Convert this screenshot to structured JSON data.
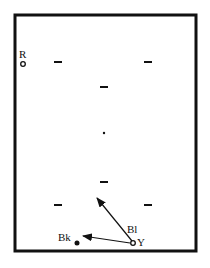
{
  "diagram": {
    "type": "snooker-table-shot-diagram",
    "table": {
      "x": 15,
      "y": 15,
      "width": 181,
      "height": 236,
      "border_color": "#111111",
      "border_width": 3
    },
    "balls": [
      {
        "id": "R",
        "label": "R",
        "x": 23,
        "y": 64,
        "style": "hollow",
        "label_x": 19,
        "label_y": 58
      },
      {
        "id": "Bk",
        "label": "Bk",
        "x": 77,
        "y": 243,
        "style": "filled",
        "label_x": 58,
        "label_y": 241
      },
      {
        "id": "Bl",
        "label": "Bl",
        "x": 104,
        "y": 133,
        "style": "dot",
        "label_x": 127,
        "label_y": 233
      },
      {
        "id": "Y",
        "label": "Y",
        "x": 133,
        "y": 243,
        "style": "hollow",
        "label_x": 137,
        "label_y": 246
      }
    ],
    "spot_marks": [
      {
        "x": 58,
        "y": 62
      },
      {
        "x": 148,
        "y": 62
      },
      {
        "x": 104,
        "y": 87
      },
      {
        "x": 104,
        "y": 182
      },
      {
        "x": 58,
        "y": 205
      },
      {
        "x": 148,
        "y": 205
      }
    ],
    "arrows": [
      {
        "from": [
          132,
          241
        ],
        "to": [
          97,
          198
        ]
      },
      {
        "from": [
          130,
          243
        ],
        "to": [
          83,
          236
        ]
      }
    ],
    "color": "#111111"
  }
}
